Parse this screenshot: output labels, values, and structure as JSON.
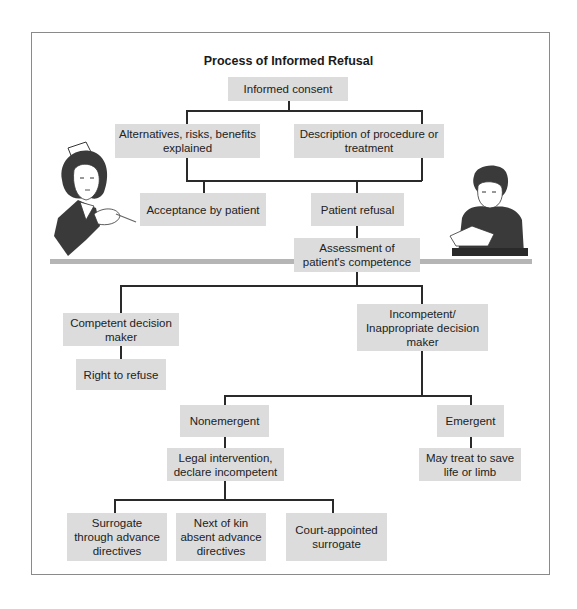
{
  "diagram": {
    "title": "Process of Informed Refusal",
    "nodes": {
      "informed_consent": "Informed consent",
      "alternatives": "Alternatives, risks, benefits explained",
      "description": "Description of procedure or treatment",
      "acceptance": "Acceptance by patient",
      "refusal": "Patient refusal",
      "assessment": "Assessment of patient's competence",
      "competent": "Competent decision maker",
      "right_to_refuse": "Right to refuse",
      "incompetent": "Incompetent/ Inappropriate decision maker",
      "nonemergent": "Nonemergent",
      "emergent": "Emergent",
      "legal": "Legal intervention, declare incompetent",
      "may_treat": "May treat to save life or limb",
      "surrogate_advance": "Surrogate through advance directives",
      "next_of_kin": "Next of kin absent advance directives",
      "court_surrogate": "Court-appointed surrogate"
    },
    "illustrations": {
      "left": "nurse-illustration",
      "right": "patient-reading-illustration"
    },
    "colors": {
      "box_fill": "#dcdcdc",
      "connector": "#2a2a2a",
      "band": "#b5b5b5",
      "frame": "#8a8a8a"
    }
  }
}
